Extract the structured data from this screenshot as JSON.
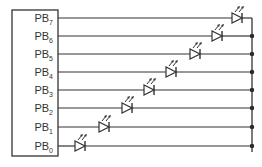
{
  "diagram": {
    "type": "circuit-schematic",
    "colors": {
      "line": "#333333",
      "background": "#ffffff"
    },
    "port": {
      "pins": [
        {
          "name": "PB",
          "index": "7",
          "y": 18,
          "led_x": 232
        },
        {
          "name": "PB",
          "index": "6",
          "y": 36,
          "led_x": 212
        },
        {
          "name": "PB",
          "index": "5",
          "y": 54,
          "led_x": 190
        },
        {
          "name": "PB",
          "index": "4",
          "y": 72,
          "led_x": 166
        },
        {
          "name": "PB",
          "index": "3",
          "y": 90,
          "led_x": 144
        },
        {
          "name": "PB",
          "index": "2",
          "y": 108,
          "led_x": 122
        },
        {
          "name": "PB",
          "index": "1",
          "y": 127,
          "led_x": 99
        },
        {
          "name": "PB",
          "index": "0",
          "y": 146,
          "led_x": 75
        }
      ]
    },
    "component": "LED",
    "bus_x": 252
  }
}
